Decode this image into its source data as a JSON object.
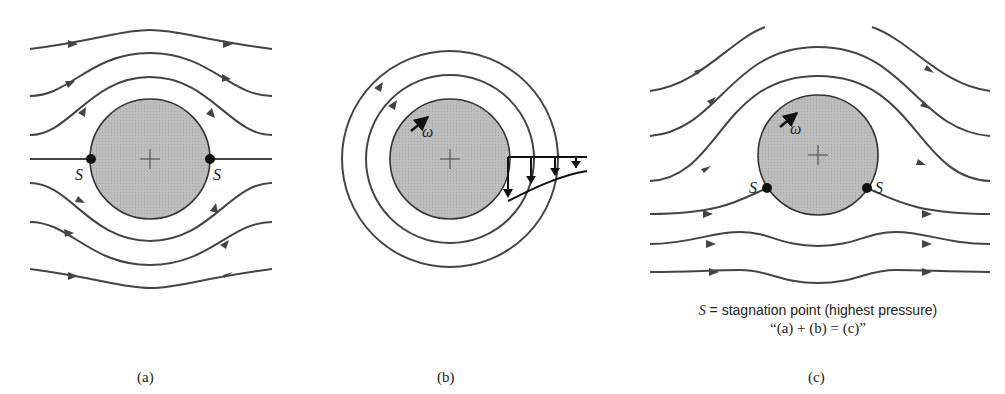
{
  "figure": {
    "panels": [
      {
        "id": "a",
        "label": "(a)",
        "description": "uniform flow past cylinder",
        "stagnation_labels": [
          "S",
          "S"
        ]
      },
      {
        "id": "b",
        "label": "(b)",
        "description": "free vortex / rotating cylinder",
        "omega_label": "ω"
      },
      {
        "id": "c",
        "label": "(c)",
        "description": "flow past rotating cylinder",
        "omega_label": "ω",
        "stagnation_labels": [
          "S",
          "S"
        ]
      }
    ],
    "caption": {
      "line1_symbol": "S",
      "line1_text": " = stagnation point (highest pressure)",
      "line2": "“(a) + (b) = (c)”"
    },
    "colors": {
      "cylinder_fill": "#b8b8b8",
      "line": "#444444",
      "background": "#ffffff"
    }
  }
}
